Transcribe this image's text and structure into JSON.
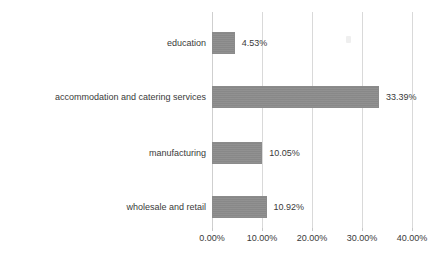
{
  "chart_data": {
    "type": "bar",
    "orientation": "horizontal",
    "title": "",
    "subtitle": "",
    "xlabel": "",
    "ylabel": "",
    "categories": [
      "education",
      "accommodation and catering services",
      "manufacturing",
      "wholesale and retail"
    ],
    "values": [
      4.53,
      33.39,
      10.05,
      10.92
    ],
    "value_labels": [
      "4.53%",
      "33.39%",
      "10.05%",
      "10.92%"
    ],
    "xlim": [
      0,
      40
    ],
    "xticks": [
      0,
      10,
      20,
      30,
      40
    ],
    "xtick_labels": [
      "0.00%",
      "10.00%",
      "20.00%",
      "30.00%",
      "40.00%"
    ],
    "grid": true,
    "grid_axis": "x",
    "legend": false,
    "series": [
      {
        "name": "share",
        "values": [
          4.53,
          33.39,
          10.05,
          10.92
        ],
        "color": "#8b8b8b"
      }
    ]
  },
  "style": {
    "background": "#ffffff",
    "bar_color": "#8b8b8b",
    "grid_color": "#d9d9d9",
    "text_color": "#3a3a3a"
  }
}
